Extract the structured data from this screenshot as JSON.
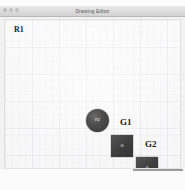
{
  "window": {
    "title": "Drawing Editor",
    "controls": [
      {
        "name": "close",
        "label": ""
      },
      {
        "name": "minimize",
        "label": ""
      },
      {
        "name": "zoom",
        "label": ""
      }
    ]
  },
  "canvas": {
    "region_label": "R1",
    "shapes": [
      {
        "id": "robot-r2",
        "kind": "circle",
        "label": "R2",
        "x": 81,
        "y": 89,
        "size": 23,
        "color": "#3f3f3f"
      },
      {
        "id": "goal-box-1",
        "kind": "square",
        "label": "G",
        "outer_label": "G1",
        "x": 106,
        "y": 115,
        "size": 22,
        "color": "#3f3f3f"
      },
      {
        "id": "goal-box-2",
        "kind": "square",
        "label": "G",
        "outer_label": "G2",
        "x": 131,
        "y": 137,
        "size": 22,
        "color": "#3f3f3f"
      }
    ],
    "annotations": [
      {
        "id": "label-g1",
        "text": "G1"
      },
      {
        "id": "label-g2",
        "text": "G2"
      }
    ]
  }
}
